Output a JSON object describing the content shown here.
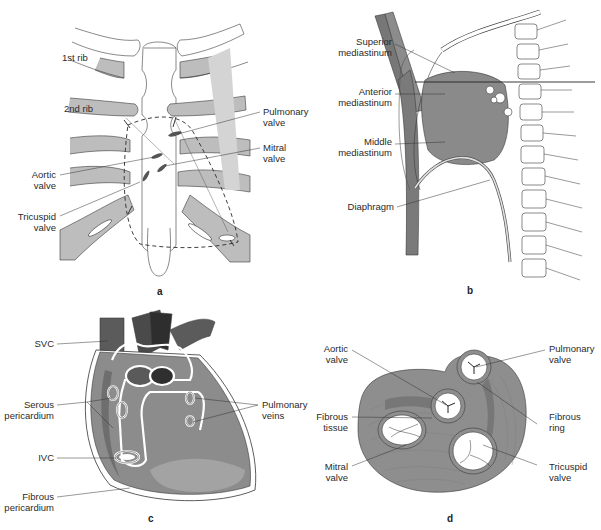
{
  "figure": {
    "panels": [
      {
        "id": "a",
        "letter": "a",
        "labels": {
          "rib1": "1st rib",
          "rib2": "2nd rib",
          "pulmonary_valve": [
            "Pulmonary",
            "valve"
          ],
          "mitral_valve": [
            "Mitral",
            "valve"
          ],
          "aortic_valve": [
            "Aortic",
            "valve"
          ],
          "tricuspid_valve": [
            "Tricuspid",
            "valve"
          ]
        }
      },
      {
        "id": "b",
        "letter": "b",
        "labels": {
          "superior_mediastinum": [
            "Superior",
            "mediastinum"
          ],
          "anterior_mediastinum": [
            "Anterior",
            "mediastinum"
          ],
          "middle_mediastinum": [
            "Middle",
            "mediastinum"
          ],
          "diaphragm": "Diaphragm"
        }
      },
      {
        "id": "c",
        "letter": "c",
        "labels": {
          "svc": "SVC",
          "serous_pericardium": [
            "Serous",
            "pericardium"
          ],
          "pulmonary_veins": [
            "Pulmonary",
            "veins"
          ],
          "ivc": "IVC",
          "fibrous_pericardium": [
            "Fibrous",
            "pericardium"
          ]
        }
      },
      {
        "id": "d",
        "letter": "d",
        "labels": {
          "aortic_valve": [
            "Aortic",
            "valve"
          ],
          "pulmonary_valve": [
            "Pulmonary",
            "valve"
          ],
          "fibrous_tissue": [
            "Fibrous",
            "tissue"
          ],
          "fibrous_ring": [
            "Fibrous",
            "ring"
          ],
          "mitral_valve": [
            "Mitral",
            "valve"
          ],
          "tricuspid_valve": [
            "Tricuspid",
            "valve"
          ]
        }
      }
    ],
    "colors": {
      "rib_fill": "#bdbdbd",
      "outline": "#3a3a3a",
      "heart_dark": "#6e6e6e",
      "heart_mid": "#8c8c8c",
      "heart_light": "#a8a8a8",
      "vessel_dark": "#4a4a4a",
      "background": "#ffffff"
    }
  }
}
